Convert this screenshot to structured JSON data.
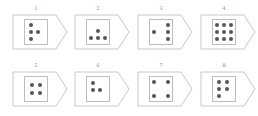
{
  "figure": {
    "cards": [
      {
        "label": "1",
        "dots": [
          [
            0.25,
            0.2
          ],
          [
            0.25,
            0.5
          ],
          [
            0.58,
            0.5
          ],
          [
            0.25,
            0.8
          ]
        ]
      },
      {
        "label": "2",
        "dots": [
          [
            0.5,
            0.45
          ],
          [
            0.2,
            0.75
          ],
          [
            0.5,
            0.75
          ],
          [
            0.8,
            0.75
          ]
        ]
      },
      {
        "label": "3",
        "dots": [
          [
            0.8,
            0.2
          ],
          [
            0.2,
            0.5
          ],
          [
            0.8,
            0.5
          ],
          [
            0.8,
            0.8
          ]
        ]
      },
      {
        "label": "4",
        "dots": [
          [
            0.2,
            0.2
          ],
          [
            0.5,
            0.2
          ],
          [
            0.8,
            0.2
          ],
          [
            0.2,
            0.5
          ],
          [
            0.5,
            0.5
          ],
          [
            0.8,
            0.5
          ],
          [
            0.2,
            0.8
          ],
          [
            0.5,
            0.8
          ],
          [
            0.8,
            0.8
          ]
        ]
      },
      {
        "label": "5",
        "dots": [
          [
            0.3,
            0.35
          ],
          [
            0.7,
            0.35
          ],
          [
            0.3,
            0.65
          ],
          [
            0.7,
            0.65
          ]
        ]
      },
      {
        "label": "6",
        "dots": [
          [
            0.25,
            0.25
          ],
          [
            0.25,
            0.55
          ],
          [
            0.58,
            0.55
          ]
        ]
      },
      {
        "label": "7",
        "dots": [
          [
            0.2,
            0.2
          ],
          [
            0.8,
            0.2
          ],
          [
            0.2,
            0.8
          ],
          [
            0.8,
            0.8
          ]
        ]
      },
      {
        "label": "8",
        "dots": [
          [
            0.25,
            0.2
          ],
          [
            0.62,
            0.2
          ],
          [
            0.25,
            0.5
          ],
          [
            0.62,
            0.5
          ],
          [
            0.25,
            0.8
          ]
        ]
      }
    ],
    "colors": {
      "outline": "#c8c8c8",
      "dot": "#555555",
      "label": "#888888"
    }
  }
}
